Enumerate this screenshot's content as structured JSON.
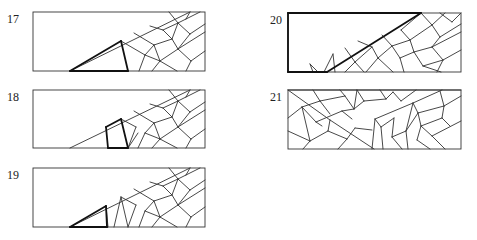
{
  "panels": [
    {
      "id": "17",
      "label": "17",
      "label_pos": [
        7,
        13
      ],
      "box": [
        33,
        12,
        205,
        71
      ],
      "thin": [
        [
          70,
          71,
          190,
          12
        ],
        [
          121,
          41,
          145,
          55
        ],
        [
          145,
          55,
          139,
          71
        ],
        [
          145,
          55,
          160,
          61
        ],
        [
          160,
          61,
          152,
          71
        ],
        [
          134,
          33,
          154,
          45
        ],
        [
          154,
          45,
          145,
          55
        ],
        [
          154,
          45,
          172,
          39
        ],
        [
          172,
          39,
          163,
          30
        ],
        [
          150,
          26,
          163,
          30
        ],
        [
          163,
          30,
          178,
          23
        ],
        [
          160,
          61,
          177,
          71
        ],
        [
          154,
          45,
          160,
          61
        ],
        [
          172,
          39,
          178,
          49
        ],
        [
          178,
          49,
          160,
          61
        ],
        [
          178,
          49,
          205,
          32
        ],
        [
          178,
          49,
          191,
          61
        ],
        [
          191,
          61,
          205,
          51
        ],
        [
          191,
          61,
          186,
          71
        ],
        [
          178,
          23,
          172,
          39
        ],
        [
          178,
          23,
          190,
          34
        ],
        [
          190,
          34,
          205,
          24
        ],
        [
          190,
          34,
          178,
          49
        ],
        [
          178,
          23,
          169,
          12
        ],
        [
          190,
          12,
          186,
          19
        ],
        [
          186,
          19,
          178,
          23
        ],
        [
          186,
          19,
          200,
          12
        ]
      ],
      "thick": [
        [
          70,
          71,
          121,
          41
        ],
        [
          121,
          41,
          128,
          71
        ],
        [
          128,
          71,
          70,
          71
        ]
      ]
    },
    {
      "id": "18",
      "label": "18",
      "label_pos": [
        7,
        91
      ],
      "box": [
        33,
        90,
        205,
        148
      ],
      "thin": [
        [
          70,
          148,
          190,
          90
        ],
        [
          128,
          148,
          138,
          133
        ],
        [
          121,
          119,
          136,
          127
        ],
        [
          136,
          127,
          128,
          148
        ],
        [
          134,
          111,
          154,
          123
        ],
        [
          154,
          123,
          145,
          133
        ],
        [
          145,
          133,
          138,
          148
        ],
        [
          145,
          133,
          160,
          139
        ],
        [
          160,
          139,
          152,
          148
        ],
        [
          154,
          123,
          172,
          117
        ],
        [
          172,
          117,
          163,
          108
        ],
        [
          150,
          104,
          163,
          108
        ],
        [
          163,
          108,
          178,
          101
        ],
        [
          160,
          139,
          177,
          148
        ],
        [
          154,
          123,
          160,
          139
        ],
        [
          172,
          117,
          178,
          127
        ],
        [
          178,
          127,
          160,
          139
        ],
        [
          178,
          127,
          205,
          110
        ],
        [
          178,
          127,
          191,
          139
        ],
        [
          191,
          139,
          205,
          129
        ],
        [
          191,
          139,
          186,
          148
        ],
        [
          178,
          101,
          172,
          117
        ],
        [
          178,
          101,
          190,
          112
        ],
        [
          190,
          112,
          205,
          102
        ],
        [
          190,
          112,
          178,
          127
        ],
        [
          178,
          101,
          169,
          90
        ],
        [
          190,
          90,
          186,
          97
        ],
        [
          186,
          97,
          178,
          101
        ],
        [
          186,
          97,
          200,
          90
        ]
      ],
      "thick": [
        [
          106,
          127,
          121,
          119
        ],
        [
          121,
          119,
          128,
          148
        ],
        [
          128,
          148,
          108,
          148
        ],
        [
          108,
          148,
          106,
          127
        ]
      ]
    },
    {
      "id": "19",
      "label": "19",
      "label_pos": [
        7,
        169
      ],
      "box": [
        33,
        168,
        205,
        227
      ],
      "thin": [
        [
          70,
          227,
          190,
          168
        ],
        [
          106,
          206,
          108,
          227
        ],
        [
          121,
          197,
          128,
          227
        ],
        [
          121,
          197,
          114,
          227
        ],
        [
          121,
          197,
          136,
          205
        ],
        [
          136,
          205,
          128,
          227
        ],
        [
          134,
          189,
          154,
          201
        ],
        [
          154,
          201,
          145,
          211
        ],
        [
          145,
          211,
          139,
          227
        ],
        [
          145,
          211,
          160,
          217
        ],
        [
          160,
          217,
          152,
          227
        ],
        [
          154,
          201,
          172,
          195
        ],
        [
          172,
          195,
          163,
          186
        ],
        [
          150,
          182,
          163,
          186
        ],
        [
          163,
          186,
          178,
          179
        ],
        [
          160,
          217,
          177,
          227
        ],
        [
          154,
          201,
          160,
          217
        ],
        [
          172,
          195,
          178,
          205
        ],
        [
          178,
          205,
          160,
          217
        ],
        [
          178,
          205,
          205,
          188
        ],
        [
          178,
          205,
          191,
          217
        ],
        [
          191,
          217,
          205,
          207
        ],
        [
          191,
          217,
          186,
          227
        ],
        [
          178,
          179,
          172,
          195
        ],
        [
          178,
          179,
          190,
          190
        ],
        [
          190,
          190,
          205,
          180
        ],
        [
          190,
          190,
          178,
          205
        ],
        [
          178,
          179,
          169,
          168
        ],
        [
          190,
          168,
          186,
          175
        ],
        [
          186,
          175,
          178,
          179
        ],
        [
          186,
          175,
          200,
          168
        ]
      ],
      "thick": [
        [
          70,
          227,
          106,
          206
        ],
        [
          106,
          206,
          107,
          227
        ],
        [
          107,
          227,
          70,
          227
        ]
      ]
    },
    {
      "id": "20",
      "label": "20",
      "label_pos": [
        273,
        14
      ],
      "box": [
        288,
        13,
        461,
        72
      ],
      "thin": [
        [
          310,
          64,
          318,
          72
        ],
        [
          310,
          64,
          313,
          72
        ],
        [
          333,
          54,
          335,
          72
        ],
        [
          333,
          54,
          324,
          72
        ],
        [
          345,
          48,
          355,
          62
        ],
        [
          355,
          62,
          345,
          72
        ],
        [
          355,
          62,
          364,
          72
        ],
        [
          358,
          41,
          372,
          47
        ],
        [
          372,
          47,
          355,
          62
        ],
        [
          372,
          47,
          378,
          58
        ],
        [
          378,
          58,
          366,
          72
        ],
        [
          378,
          58,
          393,
          72
        ],
        [
          382,
          35,
          392,
          46
        ],
        [
          392,
          46,
          378,
          58
        ],
        [
          392,
          46,
          410,
          40
        ],
        [
          410,
          40,
          401,
          30
        ],
        [
          401,
          30,
          421,
          13
        ],
        [
          392,
          46,
          400,
          58
        ],
        [
          400,
          58,
          414,
          52
        ],
        [
          414,
          52,
          410,
          40
        ],
        [
          400,
          58,
          404,
          72
        ],
        [
          414,
          52,
          432,
          47
        ],
        [
          432,
          47,
          461,
          32
        ],
        [
          414,
          52,
          423,
          66
        ],
        [
          423,
          66,
          443,
          60
        ],
        [
          443,
          60,
          432,
          47
        ],
        [
          423,
          66,
          441,
          72
        ],
        [
          443,
          60,
          461,
          50
        ],
        [
          443,
          60,
          437,
          72
        ],
        [
          421,
          13,
          432,
          25
        ],
        [
          432,
          25,
          410,
          40
        ],
        [
          432,
          25,
          440,
          37
        ],
        [
          440,
          37,
          461,
          24
        ],
        [
          440,
          37,
          432,
          47
        ],
        [
          432,
          25,
          445,
          13
        ],
        [
          440,
          13,
          452,
          22
        ],
        [
          452,
          22,
          461,
          13
        ]
      ],
      "thick": [
        [
          288,
          13,
          421,
          13
        ],
        [
          288,
          13,
          288,
          72
        ],
        [
          288,
          72,
          327,
          72
        ],
        [
          327,
          72,
          421,
          13
        ]
      ]
    },
    {
      "id": "21",
      "label": "21",
      "label_pos": [
        273,
        91
      ],
      "box": [
        288,
        90,
        461,
        149
      ],
      "thin": [
        [
          288,
          90,
          330,
          120
        ],
        [
          330,
          120,
          374,
          149
        ],
        [
          302,
          107,
          320,
          101
        ],
        [
          320,
          101,
          330,
          114
        ],
        [
          302,
          107,
          316,
          122
        ],
        [
          320,
          101,
          313,
          90
        ],
        [
          320,
          101,
          345,
          96
        ],
        [
          345,
          96,
          340,
          90
        ],
        [
          288,
          118,
          302,
          107
        ],
        [
          302,
          107,
          310,
          141
        ],
        [
          288,
          131,
          310,
          141
        ],
        [
          310,
          141,
          303,
          149
        ],
        [
          316,
          122,
          322,
          126
        ],
        [
          316,
          122,
          342,
          111
        ],
        [
          342,
          111,
          352,
          119
        ],
        [
          330,
          120,
          328,
          131
        ],
        [
          328,
          131,
          310,
          141
        ],
        [
          328,
          131,
          347,
          139
        ],
        [
          347,
          139,
          355,
          128
        ],
        [
          345,
          96,
          354,
          109
        ],
        [
          354,
          109,
          342,
          111
        ],
        [
          354,
          109,
          357,
          90
        ],
        [
          357,
          90,
          364,
          101
        ],
        [
          364,
          101,
          354,
          109
        ],
        [
          364,
          101,
          386,
          99
        ],
        [
          386,
          99,
          380,
          90
        ],
        [
          386,
          99,
          393,
          92
        ],
        [
          393,
          92,
          401,
          101
        ],
        [
          401,
          101,
          416,
          90
        ],
        [
          375,
          119,
          413,
          103
        ],
        [
          413,
          103,
          442,
          90
        ],
        [
          375,
          119,
          372,
          149
        ],
        [
          375,
          119,
          381,
          127
        ],
        [
          381,
          127,
          383,
          149
        ],
        [
          381,
          127,
          394,
          118
        ],
        [
          394,
          118,
          392,
          137
        ],
        [
          392,
          137,
          402,
          149
        ],
        [
          392,
          137,
          406,
          131
        ],
        [
          406,
          131,
          413,
          103
        ],
        [
          413,
          103,
          418,
          113
        ],
        [
          418,
          113,
          444,
          106
        ],
        [
          444,
          106,
          440,
          91
        ],
        [
          418,
          113,
          406,
          131
        ],
        [
          418,
          113,
          421,
          126
        ],
        [
          421,
          126,
          442,
          118
        ],
        [
          442,
          118,
          444,
          106
        ],
        [
          421,
          126,
          417,
          140
        ],
        [
          417,
          140,
          430,
          149
        ],
        [
          421,
          126,
          432,
          136
        ],
        [
          432,
          136,
          461,
          121
        ],
        [
          444,
          106,
          461,
          96
        ],
        [
          432,
          136,
          445,
          149
        ],
        [
          442,
          118,
          450,
          126
        ],
        [
          406,
          131,
          408,
          149
        ],
        [
          347,
          139,
          338,
          149
        ],
        [
          355,
          128,
          372,
          130
        ],
        [
          288,
          90,
          461,
          90
        ]
      ],
      "thick": []
    }
  ]
}
